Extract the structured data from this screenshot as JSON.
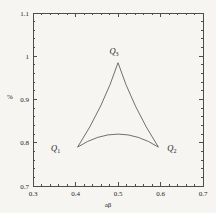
{
  "figure": {
    "background": "#f6f5f2",
    "frame_color": "#4d4d4d",
    "tick_color": "#4d4d4d",
    "curve_color": "#606060",
    "text_color": "#262626"
  },
  "chart_data": {
    "type": "line",
    "title": "",
    "xlabel": "aβ",
    "ylabel": "%",
    "xlim": [
      0.3,
      0.7
    ],
    "ylim": [
      0.7,
      1.1
    ],
    "x_ticks": [
      0.3,
      0.4,
      0.5,
      0.6,
      0.7
    ],
    "x_tick_labels": [
      "0.3",
      "0.4",
      "0.5",
      "0.6",
      "0.7"
    ],
    "y_ticks": [
      0.7,
      0.8,
      0.9,
      1.0,
      1.1
    ],
    "y_tick_labels": [
      "0.7",
      "0.8",
      "0.9",
      "1",
      "1.1"
    ],
    "minor_tick_step": 0.02,
    "grid": false,
    "legend": null,
    "curve": {
      "description": "Closed curvilinear triangle (deltoid-like) with three cusps; all three sides bow slightly toward the centroid.",
      "cusps": [
        {
          "name": "Q1",
          "x": 0.405,
          "y": 0.79
        },
        {
          "name": "Q2",
          "x": 0.595,
          "y": 0.79
        },
        {
          "name": "Q3",
          "x": 0.5,
          "y": 0.985
        }
      ],
      "bezier_controls": {
        "left_side": {
          "x": 0.466,
          "y": 0.883
        },
        "right_side": {
          "x": 0.534,
          "y": 0.883
        },
        "bottom_side": {
          "x": 0.5,
          "y": 0.85
        }
      },
      "bottom_arc_apex": {
        "x": 0.5,
        "y": 0.822
      }
    },
    "annotations": [
      {
        "base": "Q",
        "sub": "1",
        "anchor": "Q1"
      },
      {
        "base": "Q",
        "sub": "2",
        "anchor": "Q2"
      },
      {
        "base": "Q",
        "sub": "3",
        "anchor": "Q3"
      }
    ]
  }
}
